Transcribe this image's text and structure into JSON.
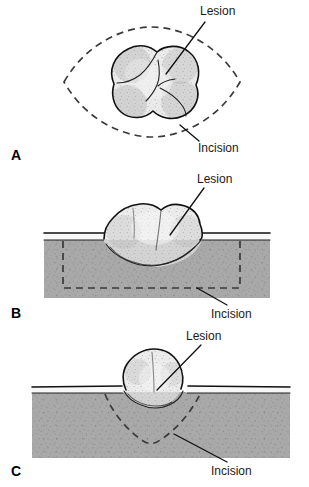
{
  "figure": {
    "panels": [
      {
        "id": "A",
        "letter": "A",
        "view": "surface view",
        "labels": {
          "lesion": "Lesion",
          "incision": "Incision"
        }
      },
      {
        "id": "B",
        "letter": "B",
        "view": "cross-section, wide deep excision",
        "labels": {
          "lesion": "Lesion",
          "incision": "Incision"
        }
      },
      {
        "id": "C",
        "letter": "C",
        "view": "cross-section, wedge excision",
        "labels": {
          "lesion": "Lesion",
          "incision": "Incision"
        }
      }
    ]
  },
  "colors": {
    "background": "#ffffff",
    "dermis_fill": "#a9a9a9",
    "dermis_stipple": "#6f6f6f",
    "lesion_fill": "#ebebeb",
    "lesion_stipple": "#8a8a8a",
    "epidermis_fill": "#f6f6f6",
    "outline": "#111111",
    "incision_dash": "#3a3a3a",
    "label_text": "#1a1a1a"
  }
}
